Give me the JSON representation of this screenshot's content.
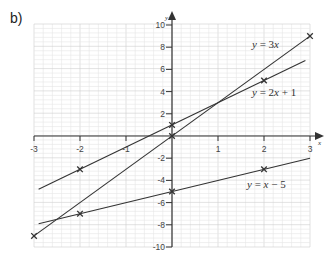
{
  "part_label": "b)",
  "chart_data": {
    "type": "line",
    "title": "",
    "xlabel": "x",
    "ylabel": "y",
    "xlim": [
      -3,
      3
    ],
    "ylim": [
      -10,
      10
    ],
    "grid": true,
    "x_ticks": [
      -3,
      -2,
      -1,
      1,
      2,
      3
    ],
    "x_tick_labels": [
      "-3",
      "-2",
      "-1",
      "1",
      "2",
      "3"
    ],
    "y_ticks": [
      10,
      8,
      6,
      4,
      2,
      -2,
      -4,
      -6,
      -8,
      -10
    ],
    "y_tick_labels": [
      "10",
      "8",
      "6",
      "4",
      "2",
      "-2",
      "-4",
      "-6",
      "-8",
      "-10"
    ],
    "series": [
      {
        "name": "y = 3x",
        "label": "y = 3x",
        "slope": 3,
        "intercept": 0,
        "line_x": [
          -3,
          3
        ],
        "markers": [
          {
            "x": -3,
            "y": -9
          },
          {
            "x": 0,
            "y": 0
          },
          {
            "x": 3,
            "y": 9
          }
        ],
        "label_pos": {
          "x": 252,
          "y": 48
        }
      },
      {
        "name": "y = 2x + 1",
        "label": "y = 2x + 1",
        "slope": 2,
        "intercept": 1,
        "line_x": [
          -2.9,
          2.9
        ],
        "markers": [
          {
            "x": -2,
            "y": -3
          },
          {
            "x": 0,
            "y": 1
          },
          {
            "x": 2,
            "y": 5
          }
        ],
        "label_pos": {
          "x": 252,
          "y": 96
        }
      },
      {
        "name": "y = x - 5",
        "label": "y = x − 5",
        "slope": 1,
        "intercept": -5,
        "line_x": [
          -2.9,
          3
        ],
        "markers": [
          {
            "x": -2,
            "y": -7
          },
          {
            "x": 0,
            "y": -5
          },
          {
            "x": 2,
            "y": -3
          }
        ],
        "label_pos": {
          "x": 247,
          "y": 188
        }
      }
    ]
  },
  "colors": {
    "line": "#333333",
    "axis": "#333333",
    "grid_minor": "#e6e6e6",
    "grid_major": "#cfcfcf"
  }
}
